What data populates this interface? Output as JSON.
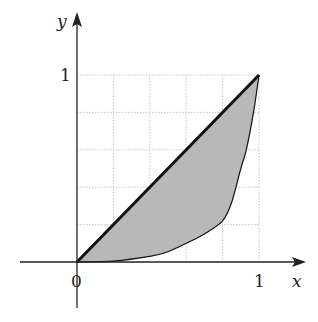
{
  "chart_data": {
    "type": "area",
    "title": "",
    "xlabel": "x",
    "ylabel": "y",
    "xlim": [
      0,
      1
    ],
    "ylim": [
      0,
      1
    ],
    "x_ticks": [
      "0",
      "1"
    ],
    "y_ticks": [
      "1"
    ],
    "grid": true,
    "grid_step": 0.2,
    "series": [
      {
        "name": "line y = x",
        "style": "thick solid",
        "x": [
          0,
          1
        ],
        "y": [
          0,
          1
        ]
      },
      {
        "name": "curve",
        "style": "thin solid",
        "x": [
          0,
          0.2,
          0.4,
          0.5,
          0.6,
          0.7,
          0.8,
          0.85,
          0.9,
          0.93,
          0.97,
          1
        ],
        "y": [
          0,
          0.005,
          0.03,
          0.055,
          0.1,
          0.15,
          0.22,
          0.32,
          0.5,
          0.6,
          0.8,
          1
        ]
      }
    ],
    "shaded_region": "between y = x and curve, 0 ≤ x ≤ 1"
  },
  "labels": {
    "x_axis": "x",
    "y_axis": "y",
    "origin": "0",
    "x_one": "1",
    "y_one": "1"
  },
  "colors": {
    "axis": "#222222",
    "grid": "#c8c8c8",
    "fill": "#b8b8b8",
    "line": "#111111"
  }
}
